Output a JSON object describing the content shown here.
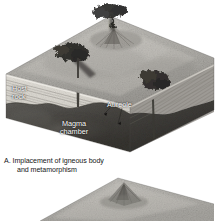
{
  "figure": {
    "kind": "geological-block-diagram",
    "background_color": "#ffffff",
    "panel_a": {
      "caption_line1": "A. Implacement of igneous body",
      "caption_line2": "and metamorphism",
      "labels": {
        "host_rock_line1": "Host",
        "host_rock_line2": "rock",
        "aureole": "Aureole",
        "magma_line1": "Magma",
        "magma_line2": "chamber"
      },
      "features": {
        "volcano_top": "volcano-with-eruption-plume",
        "intrusion_left": "dark-igneous-intrusion",
        "intrusion_right": "dark-igneous-intrusion",
        "conduit_left": "magma-conduit",
        "conduit_right": "magma-conduit",
        "strata": "horizontal-sedimentary-layers",
        "magma_body": "dark-magma-chamber"
      }
    },
    "panel_b": {
      "note": "second block diagram, cropped at bottom edge",
      "features": {
        "volcano": "eroded-volcanic-peak",
        "surface": "terrain-surface"
      }
    },
    "colors": {
      "surface_light": "#b9b7b2",
      "surface_mid": "#9c9a95",
      "strata_light": "#dedbd4",
      "strata_line": "#8f8d88",
      "magma_dark": "#4a4845",
      "side_face": "#6f6d69",
      "label_text": "#ffffff",
      "caption_text": "#161616",
      "intrusion": "#2b2a28"
    }
  }
}
